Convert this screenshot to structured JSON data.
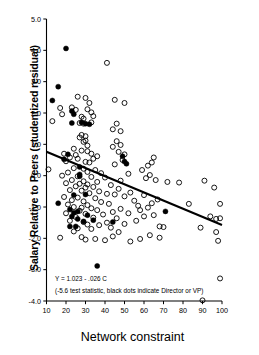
{
  "chart_data": {
    "type": "scatter",
    "title": "",
    "xlabel": "Network constraint",
    "ylabel": "Salary Relative to Peers (studentized residual)",
    "xlim": [
      10,
      100
    ],
    "ylim": [
      -4.0,
      5.0
    ],
    "xticks": [
      10,
      20,
      30,
      40,
      50,
      60,
      70,
      80,
      90,
      100
    ],
    "xtick_labels": [
      "10",
      "20",
      "30",
      "40",
      "50",
      "60",
      "70",
      "80",
      "90",
      "100"
    ],
    "yticks": [
      -4.0,
      -3.0,
      -2.0,
      -1.0,
      0.0,
      1.0,
      2.0,
      3.0,
      4.0,
      5.0
    ],
    "ytick_labels": [
      "-4.0",
      "-3.0",
      "-2.0",
      "-1.0",
      "0.0",
      "1.0",
      "2.0",
      "3.0",
      "4.0",
      "5.0"
    ],
    "grid": false,
    "legend": "none",
    "annotations": [
      "Y = 1.023 - .026 C",
      "(-5.6 test statistic, black dots indicate Director or VP)"
    ],
    "fit_line": {
      "equation": "Y = 1.023 - .026 C",
      "intercept": 1.023,
      "slope": -0.026,
      "test_statistic": -5.6,
      "x_start": 10,
      "y_start": 0.763,
      "x_end": 100,
      "y_end": -1.577,
      "color": "#000000"
    },
    "series": [
      {
        "name": "Director or VP",
        "marker": "filled-circle",
        "color": "#000000",
        "points": [
          [
            13,
            2.4
          ],
          [
            16,
            2.84
          ],
          [
            20,
            4.06
          ],
          [
            23,
            2.06
          ],
          [
            24,
            1.96
          ],
          [
            23,
            1.68
          ],
          [
            28,
            1.7
          ],
          [
            30,
            1.66
          ],
          [
            32,
            1.64
          ],
          [
            21,
            0.68
          ],
          [
            19,
            0.52
          ],
          [
            27,
            0.28
          ],
          [
            27,
            0.04
          ],
          [
            27,
            -0.02
          ],
          [
            49,
            0.62
          ],
          [
            50,
            0.45
          ],
          [
            51,
            0.38
          ],
          [
            16,
            -0.88
          ],
          [
            24,
            -0.62
          ],
          [
            30,
            -0.6
          ],
          [
            22,
            -1.08
          ],
          [
            24,
            -1.18
          ],
          [
            26,
            -1.14
          ],
          [
            23,
            -1.3
          ],
          [
            31,
            -1.26
          ],
          [
            26,
            -1.38
          ],
          [
            29,
            -1.46
          ],
          [
            34,
            -1.42
          ],
          [
            22,
            -1.62
          ],
          [
            25,
            -1.62
          ],
          [
            44,
            -1.48
          ],
          [
            36,
            -2.88
          ],
          [
            71,
            -1.14
          ]
        ]
      },
      {
        "name": "Other employees",
        "marker": "open-circle",
        "color": "#000000",
        "points": [
          [
            41,
            3.6
          ],
          [
            26,
            2.52
          ],
          [
            30,
            2.48
          ],
          [
            32,
            2.32
          ],
          [
            45,
            2.42
          ],
          [
            50,
            2.32
          ],
          [
            17,
            2.16
          ],
          [
            23,
            2.18
          ],
          [
            25,
            2.1
          ],
          [
            31,
            2.12
          ],
          [
            33,
            2.02
          ],
          [
            18,
            1.96
          ],
          [
            28,
            1.88
          ],
          [
            29,
            1.82
          ],
          [
            34,
            1.9
          ],
          [
            13,
            1.74
          ],
          [
            27,
            1.68
          ],
          [
            29,
            1.66
          ],
          [
            33,
            1.7
          ],
          [
            46,
            1.66
          ],
          [
            44,
            1.48
          ],
          [
            48,
            1.42
          ],
          [
            28,
            1.3
          ],
          [
            30,
            1.26
          ],
          [
            27,
            1.22
          ],
          [
            30,
            1.12
          ],
          [
            29,
            1.08
          ],
          [
            46,
            1.1
          ],
          [
            48,
            0.98
          ],
          [
            31,
            0.96
          ],
          [
            44,
            0.92
          ],
          [
            24,
            0.86
          ],
          [
            28,
            0.8
          ],
          [
            31,
            0.78
          ],
          [
            47,
            0.76
          ],
          [
            65,
            0.58
          ],
          [
            19,
            0.7
          ],
          [
            25,
            0.66
          ],
          [
            33,
            0.7
          ],
          [
            36,
            0.62
          ],
          [
            50,
            0.68
          ],
          [
            22,
            0.58
          ],
          [
            26,
            0.54
          ],
          [
            34,
            0.54
          ],
          [
            49,
            0.5
          ],
          [
            64,
            0.42
          ],
          [
            20,
            0.46
          ],
          [
            30,
            0.44
          ],
          [
            32,
            0.42
          ],
          [
            45,
            0.36
          ],
          [
            62,
            0.32
          ],
          [
            11,
            0.2
          ],
          [
            24,
            0.24
          ],
          [
            29,
            0.22
          ],
          [
            35,
            0.18
          ],
          [
            59,
            0.18
          ],
          [
            21,
            0.1
          ],
          [
            31,
            0.12
          ],
          [
            38,
            0.08
          ],
          [
            52,
            0.06
          ],
          [
            63,
            0.02
          ],
          [
            18,
            0.0
          ],
          [
            26,
            -0.02
          ],
          [
            33,
            -0.04
          ],
          [
            40,
            -0.06
          ],
          [
            61,
            -0.08
          ],
          [
            23,
            -0.14
          ],
          [
            29,
            -0.18
          ],
          [
            36,
            -0.2
          ],
          [
            48,
            -0.16
          ],
          [
            66,
            -0.14
          ],
          [
            20,
            -0.24
          ],
          [
            27,
            -0.26
          ],
          [
            31,
            -0.28
          ],
          [
            43,
            -0.3
          ],
          [
            72,
            -0.2
          ],
          [
            25,
            -0.34
          ],
          [
            30,
            -0.38
          ],
          [
            34,
            -0.36
          ],
          [
            47,
            -0.42
          ],
          [
            78,
            -0.22
          ],
          [
            22,
            -0.46
          ],
          [
            28,
            -0.48
          ],
          [
            37,
            -0.5
          ],
          [
            53,
            -0.54
          ],
          [
            91,
            -0.16
          ],
          [
            32,
            -0.56
          ],
          [
            41,
            -0.58
          ],
          [
            45,
            -0.6
          ],
          [
            60,
            -0.62
          ],
          [
            96,
            -0.38
          ],
          [
            19,
            -0.68
          ],
          [
            26,
            -0.7
          ],
          [
            35,
            -0.72
          ],
          [
            50,
            -0.66
          ],
          [
            67,
            -0.76
          ],
          [
            23,
            -0.78
          ],
          [
            29,
            -0.82
          ],
          [
            38,
            -0.84
          ],
          [
            55,
            -0.8
          ],
          [
            64,
            -0.88
          ],
          [
            21,
            -0.92
          ],
          [
            31,
            -0.94
          ],
          [
            42,
            -0.9
          ],
          [
            57,
            -0.96
          ],
          [
            83,
            -0.9
          ],
          [
            24,
            -1.0
          ],
          [
            28,
            -1.02
          ],
          [
            33,
            -1.04
          ],
          [
            48,
            -1.06
          ],
          [
            62,
            -1.02
          ],
          [
            27,
            -1.12
          ],
          [
            36,
            -1.1
          ],
          [
            44,
            -1.16
          ],
          [
            58,
            -1.1
          ],
          [
            99,
            -0.9
          ],
          [
            20,
            -1.2
          ],
          [
            30,
            -1.22
          ],
          [
            39,
            -1.24
          ],
          [
            52,
            -1.2
          ],
          [
            65,
            -1.26
          ],
          [
            25,
            -1.32
          ],
          [
            34,
            -1.34
          ],
          [
            46,
            -1.36
          ],
          [
            60,
            -1.3
          ],
          [
            94,
            -1.3
          ],
          [
            22,
            -1.44
          ],
          [
            29,
            -1.48
          ],
          [
            41,
            -1.5
          ],
          [
            56,
            -1.44
          ],
          [
            97,
            -1.38
          ],
          [
            31,
            -1.56
          ],
          [
            37,
            -1.58
          ],
          [
            50,
            -1.54
          ],
          [
            68,
            -1.62
          ],
          [
            70,
            -1.64
          ],
          [
            26,
            -1.68
          ],
          [
            33,
            -1.7
          ],
          [
            43,
            -1.66
          ],
          [
            99,
            -1.36
          ],
          [
            89,
            -1.66
          ],
          [
            17,
            -1.98
          ],
          [
            24,
            -1.78
          ],
          [
            35,
            -2.02
          ],
          [
            47,
            -1.8
          ],
          [
            97,
            -1.8
          ],
          [
            28,
            -1.96
          ],
          [
            40,
            -2.06
          ],
          [
            53,
            -2.1
          ],
          [
            63,
            -1.9
          ],
          [
            98,
            -2.08
          ],
          [
            44,
            -1.94
          ],
          [
            58,
            -2.02
          ],
          [
            68,
            -1.98
          ],
          [
            30,
            -2.04
          ],
          [
            99,
            -3.28
          ],
          [
            90,
            -3.98
          ]
        ]
      }
    ]
  },
  "axes": {
    "x_axis_name": "Network constraint",
    "y_axis_name": "Salary Relative to Peers (studentized residual)"
  }
}
